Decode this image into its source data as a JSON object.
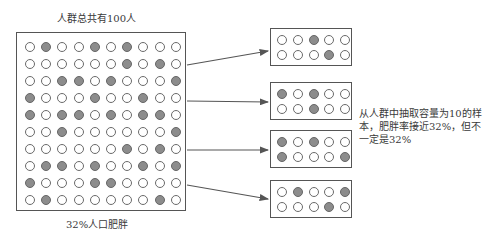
{
  "labels": {
    "population_title": "人群总共有100人",
    "population_caption": "32%人口肥胖",
    "note": "从人群中抽取容量为10的样本，肥胖率接近32%，但不一定是32%"
  },
  "population": {
    "total": 100,
    "obese_count": 32,
    "rows": [
      [
        0,
        1,
        0,
        0,
        1,
        0,
        1,
        0,
        0,
        0
      ],
      [
        0,
        0,
        0,
        0,
        0,
        0,
        1,
        0,
        1,
        0
      ],
      [
        0,
        0,
        1,
        1,
        0,
        1,
        0,
        0,
        0,
        1
      ],
      [
        1,
        0,
        0,
        0,
        1,
        0,
        0,
        1,
        0,
        0
      ],
      [
        1,
        0,
        1,
        1,
        0,
        1,
        0,
        1,
        1,
        0
      ],
      [
        0,
        0,
        1,
        0,
        0,
        0,
        0,
        0,
        0,
        1
      ],
      [
        0,
        0,
        0,
        0,
        0,
        0,
        1,
        0,
        1,
        0
      ],
      [
        0,
        1,
        1,
        0,
        1,
        0,
        0,
        1,
        0,
        1
      ],
      [
        1,
        0,
        0,
        0,
        1,
        1,
        0,
        0,
        0,
        0
      ],
      [
        0,
        1,
        0,
        0,
        0,
        0,
        0,
        0,
        1,
        0
      ]
    ]
  },
  "samples": [
    {
      "top": 28,
      "rows": [
        [
          0,
          0,
          1,
          0,
          0
        ],
        [
          0,
          0,
          0,
          1,
          0
        ]
      ]
    },
    {
      "top": 82,
      "rows": [
        [
          1,
          0,
          1,
          0,
          0
        ],
        [
          0,
          0,
          1,
          0,
          0
        ]
      ]
    },
    {
      "top": 130,
      "rows": [
        [
          1,
          0,
          1,
          0,
          0
        ],
        [
          1,
          0,
          0,
          0,
          1
        ]
      ]
    },
    {
      "top": 180,
      "rows": [
        [
          0,
          1,
          0,
          0,
          1
        ],
        [
          0,
          0,
          0,
          1,
          0
        ]
      ]
    }
  ],
  "arrows": [
    {
      "x1": 187,
      "y1": 65,
      "x2": 268,
      "y2": 51
    },
    {
      "x1": 187,
      "y1": 101,
      "x2": 268,
      "y2": 102
    },
    {
      "x1": 187,
      "y1": 150,
      "x2": 268,
      "y2": 150
    },
    {
      "x1": 187,
      "y1": 185,
      "x2": 268,
      "y2": 199
    }
  ],
  "colors": {
    "filled_dot": "#8c8c8c",
    "empty_dot": "#ffffff",
    "stroke": "#555555"
  }
}
